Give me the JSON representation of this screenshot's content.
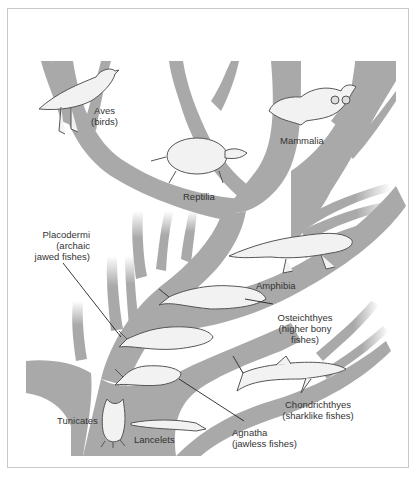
{
  "diagram": {
    "type": "evolutionary-tree",
    "colors": {
      "branch": "#a9a9a9",
      "frame": "#c8c8c8",
      "background": "#ffffff",
      "label": "#333333",
      "animal_fill": "#f2f2f2",
      "animal_stroke": "#555555"
    },
    "taxa": [
      {
        "id": "aves",
        "line1": "Aves",
        "line2": "(birds)"
      },
      {
        "id": "mammalia",
        "line1": "Mammalia"
      },
      {
        "id": "reptilia",
        "line1": "Reptilia"
      },
      {
        "id": "placodermi",
        "line1": "Placodermi",
        "line2": "(archaic",
        "line3": "jawed fishes)"
      },
      {
        "id": "amphibia",
        "line1": "Amphibia"
      },
      {
        "id": "osteichthyes",
        "line1": "Osteichthyes",
        "line2": "(higher bony",
        "line3": "fishes)"
      },
      {
        "id": "chondrichthyes",
        "line1": "Chondrichthyes",
        "line2": "(sharklike fishes)"
      },
      {
        "id": "agnatha",
        "line1": "Agnatha",
        "line2": "(jawless fishes)"
      },
      {
        "id": "tunicates",
        "line1": "Tunicates"
      },
      {
        "id": "lancelets",
        "line1": "Lancelets"
      }
    ]
  }
}
